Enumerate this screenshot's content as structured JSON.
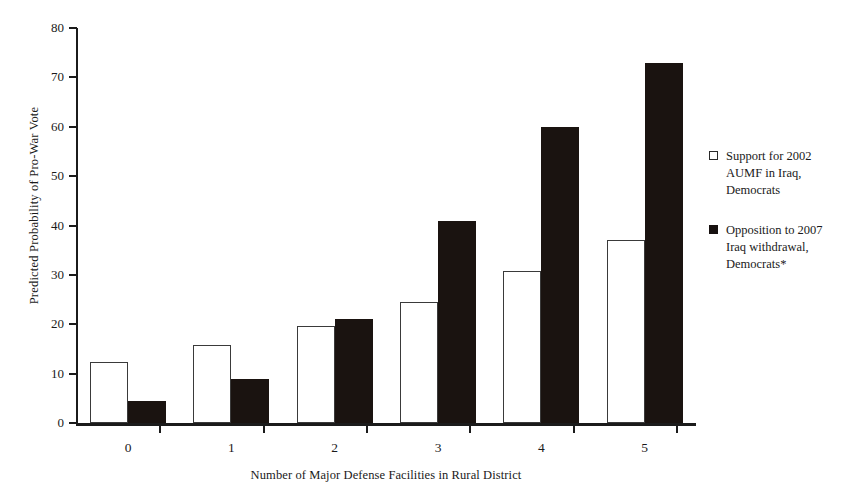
{
  "chart_data": {
    "type": "bar",
    "title": "",
    "xlabel": "Number of Major Defense Facilities in Rural District",
    "ylabel": "Predicted Probability of Pro-War Vote",
    "categories": [
      "0",
      "1",
      "2",
      "3",
      "4",
      "5"
    ],
    "ylim": [
      0,
      80
    ],
    "yticks": [
      0,
      10,
      20,
      30,
      40,
      50,
      60,
      70,
      80
    ],
    "grid": false,
    "legend_position": "right",
    "series": [
      {
        "name": "Support for 2002 AUMF in Iraq, Democrats",
        "style": "open",
        "color": "#ffffff",
        "edge_color": "#3a3a3a",
        "values": [
          12.3,
          15.8,
          19.6,
          24.5,
          30.7,
          37.0
        ]
      },
      {
        "name": "Opposition to 2007 Iraq withdrawal, Democrats*",
        "style": "filled",
        "color": "#1a1310",
        "edge_color": "#1a1310",
        "values": [
          4.5,
          8.9,
          21.0,
          41.0,
          60.0,
          73.0
        ]
      }
    ]
  },
  "axes": {
    "y_title": "Predicted Probability of Pro-War Vote",
    "x_title": "Number of Major Defense Facilities in Rural District",
    "y_tick_labels": [
      "80",
      "70",
      "60",
      "50",
      "40",
      "30",
      "20",
      "10",
      "0"
    ],
    "x_tick_labels": [
      "0",
      "1",
      "2",
      "3",
      "4",
      "5"
    ]
  },
  "legend": {
    "entries": [
      {
        "marker": "open-square-marker",
        "lines": [
          "Support for 2002",
          "AUMF in Iraq,",
          "Democrats"
        ]
      },
      {
        "marker": "filled-square-marker",
        "lines": [
          "Opposition to 2007",
          "Iraq withdrawal,",
          "Democrats*"
        ]
      }
    ]
  }
}
